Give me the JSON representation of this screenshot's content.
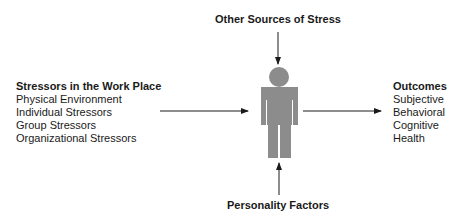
{
  "diagram": {
    "top_label": "Other Sources of Stress",
    "bottom_label": "Personality Factors",
    "left": {
      "title": "Stressors in the Work Place",
      "items": [
        "Physical Environment",
        "Individual Stressors",
        "Group Stressors",
        "Organizational Stressors"
      ]
    },
    "right": {
      "title": "Outcomes",
      "items": [
        "Subjective",
        "Behavioral",
        "Cognitive",
        "Health"
      ]
    },
    "colors": {
      "figure": "#8c8c8c",
      "arrow": "#1a1a1a",
      "text": "#1a1a1a"
    }
  }
}
